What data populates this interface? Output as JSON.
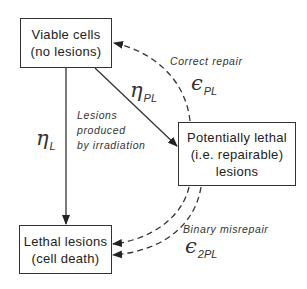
{
  "diagram": {
    "nodes": {
      "viable": {
        "line1": "Viable cells",
        "line2": "(no lesions)"
      },
      "potentially_lethal": {
        "line1": "Potentially lethal",
        "line2": "(i.e. repairable)",
        "line3": "lesions"
      },
      "lethal": {
        "line1": "Lethal lesions",
        "line2": "(cell death)"
      }
    },
    "edges": {
      "eta_l": {
        "symbol": "η",
        "subscript": "L",
        "from": "viable",
        "to": "lethal",
        "style": "solid"
      },
      "eta_pl": {
        "symbol": "η",
        "subscript": "PL",
        "from": "viable",
        "to": "potentially_lethal",
        "style": "solid"
      },
      "correct_repair": {
        "label": "Correct repair",
        "symbol": "ϵ",
        "subscript": "PL",
        "from": "potentially_lethal",
        "to": "viable",
        "style": "dashed"
      },
      "binary_misrepair": {
        "label": "Binary misrepair",
        "symbol": "ϵ",
        "subscript": "2PL",
        "from": "potentially_lethal",
        "to": "lethal",
        "style": "dashed",
        "count": 2
      }
    },
    "annotation": {
      "line1": "Lesions",
      "line2": "produced",
      "line3": "by irradiation"
    }
  }
}
